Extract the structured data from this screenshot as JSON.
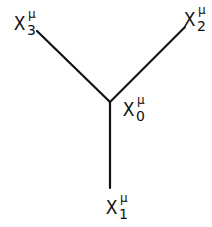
{
  "diagram": {
    "type": "vertex-graph",
    "line_color": "#111111",
    "background": "#ffffff",
    "nodes": [
      {
        "id": "x0",
        "base": "X",
        "superscript": "μ",
        "subscript": "0",
        "role": "vertex",
        "x": 110,
        "y": 102
      },
      {
        "id": "x1",
        "base": "X",
        "superscript": "μ",
        "subscript": "1",
        "role": "endpoint-bottom",
        "x": 110,
        "y": 188
      },
      {
        "id": "x2",
        "base": "X",
        "superscript": "μ",
        "subscript": "2",
        "role": "endpoint-upper-right",
        "x": 185,
        "y": 27
      },
      {
        "id": "x3",
        "base": "X",
        "superscript": "μ",
        "subscript": "3",
        "role": "endpoint-upper-left",
        "x": 37,
        "y": 31
      }
    ],
    "edges": [
      {
        "from": "x0",
        "to": "x1"
      },
      {
        "from": "x0",
        "to": "x2"
      },
      {
        "from": "x0",
        "to": "x3"
      }
    ]
  }
}
